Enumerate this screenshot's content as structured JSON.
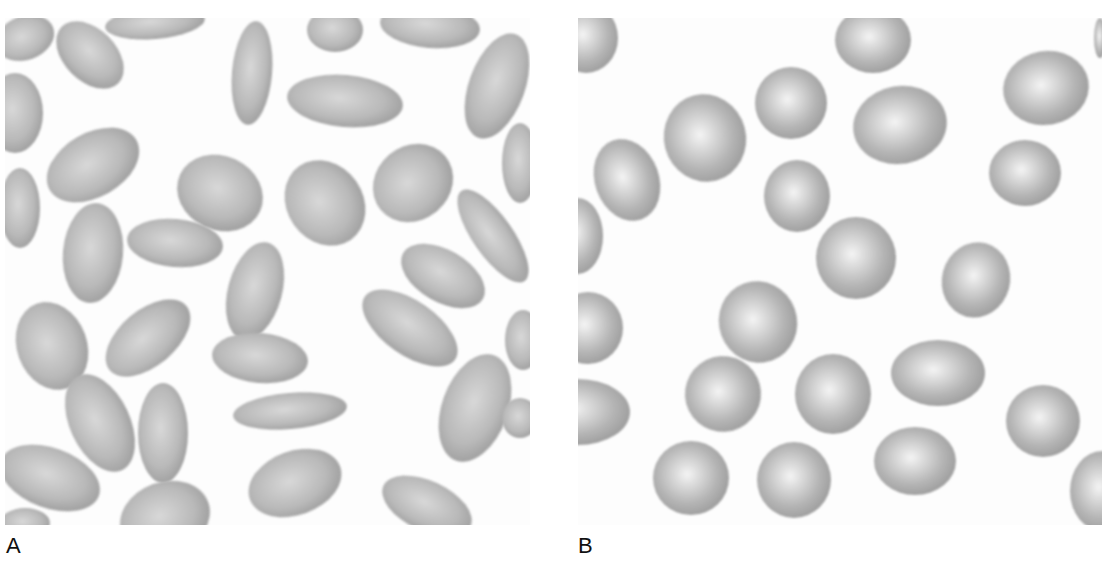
{
  "figure": {
    "panels": [
      {
        "label": "A",
        "description": "Elongated elliptical red blood cells (elliptocytes)",
        "cell_fill": "#b9b9b9",
        "cell_edge": "#9c9c9c",
        "cell_center": "#d8d8d8",
        "cells": [
          {
            "cx": 20,
            "cy": 20,
            "rx": 30,
            "ry": 22,
            "rot": -20
          },
          {
            "cx": 85,
            "cy": 37,
            "rx": 40,
            "ry": 26,
            "rot": 45
          },
          {
            "cx": 150,
            "cy": 5,
            "rx": 50,
            "ry": 16,
            "rot": -5
          },
          {
            "cx": 247,
            "cy": 55,
            "rx": 20,
            "ry": 52,
            "rot": 5
          },
          {
            "cx": 330,
            "cy": 12,
            "rx": 28,
            "ry": 22,
            "rot": 0
          },
          {
            "cx": 425,
            "cy": 8,
            "rx": 50,
            "ry": 22,
            "rot": 5
          },
          {
            "cx": 340,
            "cy": 83,
            "rx": 58,
            "ry": 26,
            "rot": 5
          },
          {
            "cx": 492,
            "cy": 68,
            "rx": 28,
            "ry": 55,
            "rot": 20
          },
          {
            "cx": 10,
            "cy": 95,
            "rx": 28,
            "ry": 40,
            "rot": 0
          },
          {
            "cx": 88,
            "cy": 147,
            "rx": 50,
            "ry": 32,
            "rot": -30
          },
          {
            "cx": 215,
            "cy": 175,
            "rx": 44,
            "ry": 37,
            "rot": 25
          },
          {
            "cx": 320,
            "cy": 185,
            "rx": 38,
            "ry": 45,
            "rot": -35
          },
          {
            "cx": 408,
            "cy": 165,
            "rx": 42,
            "ry": 37,
            "rot": -40
          },
          {
            "cx": 515,
            "cy": 145,
            "rx": 18,
            "ry": 40,
            "rot": 0
          },
          {
            "cx": 15,
            "cy": 190,
            "rx": 20,
            "ry": 40,
            "rot": 0
          },
          {
            "cx": 88,
            "cy": 235,
            "rx": 30,
            "ry": 50,
            "rot": 5
          },
          {
            "cx": 170,
            "cy": 225,
            "rx": 48,
            "ry": 24,
            "rot": 5
          },
          {
            "cx": 250,
            "cy": 273,
            "rx": 27,
            "ry": 50,
            "rot": 15
          },
          {
            "cx": 488,
            "cy": 218,
            "rx": 20,
            "ry": 55,
            "rot": -35
          },
          {
            "cx": 438,
            "cy": 258,
            "rx": 46,
            "ry": 26,
            "rot": 30
          },
          {
            "cx": 47,
            "cy": 328,
            "rx": 35,
            "ry": 45,
            "rot": -20
          },
          {
            "cx": 143,
            "cy": 320,
            "rx": 50,
            "ry": 28,
            "rot": -40
          },
          {
            "cx": 255,
            "cy": 340,
            "rx": 48,
            "ry": 25,
            "rot": 5
          },
          {
            "cx": 405,
            "cy": 310,
            "rx": 55,
            "ry": 27,
            "rot": 35
          },
          {
            "cx": 518,
            "cy": 322,
            "rx": 18,
            "ry": 30,
            "rot": 0
          },
          {
            "cx": 95,
            "cy": 405,
            "rx": 30,
            "ry": 52,
            "rot": -25
          },
          {
            "cx": 158,
            "cy": 415,
            "rx": 25,
            "ry": 50,
            "rot": 0
          },
          {
            "cx": 285,
            "cy": 393,
            "rx": 57,
            "ry": 18,
            "rot": -5
          },
          {
            "cx": 470,
            "cy": 390,
            "rx": 33,
            "ry": 56,
            "rot": 20
          },
          {
            "cx": 515,
            "cy": 400,
            "rx": 18,
            "ry": 20,
            "rot": 0
          },
          {
            "cx": 45,
            "cy": 460,
            "rx": 52,
            "ry": 30,
            "rot": 20
          },
          {
            "cx": 290,
            "cy": 465,
            "rx": 48,
            "ry": 32,
            "rot": -20
          },
          {
            "cx": 160,
            "cy": 500,
            "rx": 46,
            "ry": 36,
            "rot": -20
          },
          {
            "cx": 422,
            "cy": 488,
            "rx": 48,
            "ry": 25,
            "rot": 25
          },
          {
            "cx": 20,
            "cy": 505,
            "rx": 25,
            "ry": 15,
            "rot": 0
          }
        ]
      },
      {
        "label": "B",
        "description": "Round to slightly oval red blood cells",
        "cell_fill": "#b5b5b5",
        "cell_edge": "#9a9a9a",
        "cell_center": "#f4f4f4",
        "cells": [
          {
            "cx": 8,
            "cy": 20,
            "rx": 32,
            "ry": 35,
            "rot": 0
          },
          {
            "cx": 295,
            "cy": 22,
            "rx": 38,
            "ry": 33,
            "rot": 0
          },
          {
            "cx": 468,
            "cy": 70,
            "rx": 43,
            "ry": 37,
            "rot": -10
          },
          {
            "cx": 522,
            "cy": 20,
            "rx": 6,
            "ry": 20,
            "rot": 0
          },
          {
            "cx": 213,
            "cy": 85,
            "rx": 36,
            "ry": 36,
            "rot": 0
          },
          {
            "cx": 127,
            "cy": 120,
            "rx": 41,
            "ry": 44,
            "rot": -15
          },
          {
            "cx": 322,
            "cy": 107,
            "rx": 47,
            "ry": 39,
            "rot": -10
          },
          {
            "cx": 49,
            "cy": 162,
            "rx": 32,
            "ry": 42,
            "rot": -20
          },
          {
            "cx": 219,
            "cy": 178,
            "rx": 33,
            "ry": 36,
            "rot": 0
          },
          {
            "cx": 447,
            "cy": 155,
            "rx": 36,
            "ry": 33,
            "rot": 0
          },
          {
            "cx": 0,
            "cy": 218,
            "rx": 25,
            "ry": 38,
            "rot": 0
          },
          {
            "cx": 278,
            "cy": 240,
            "rx": 40,
            "ry": 41,
            "rot": 0
          },
          {
            "cx": 398,
            "cy": 262,
            "rx": 34,
            "ry": 38,
            "rot": 15
          },
          {
            "cx": 10,
            "cy": 310,
            "rx": 35,
            "ry": 36,
            "rot": 0
          },
          {
            "cx": 180,
            "cy": 304,
            "rx": 39,
            "ry": 41,
            "rot": -20
          },
          {
            "cx": 360,
            "cy": 355,
            "rx": 47,
            "ry": 33,
            "rot": 0
          },
          {
            "cx": 145,
            "cy": 376,
            "rx": 38,
            "ry": 38,
            "rot": -15
          },
          {
            "cx": 255,
            "cy": 376,
            "rx": 38,
            "ry": 40,
            "rot": 0
          },
          {
            "cx": 0,
            "cy": 394,
            "rx": 52,
            "ry": 33,
            "rot": 0
          },
          {
            "cx": 465,
            "cy": 403,
            "rx": 37,
            "ry": 36,
            "rot": 0
          },
          {
            "cx": 337,
            "cy": 443,
            "rx": 41,
            "ry": 34,
            "rot": 0
          },
          {
            "cx": 113,
            "cy": 460,
            "rx": 38,
            "ry": 37,
            "rot": 0
          },
          {
            "cx": 216,
            "cy": 462,
            "rx": 37,
            "ry": 38,
            "rot": 0
          },
          {
            "cx": 524,
            "cy": 473,
            "rx": 32,
            "ry": 40,
            "rot": 0
          }
        ]
      }
    ]
  }
}
